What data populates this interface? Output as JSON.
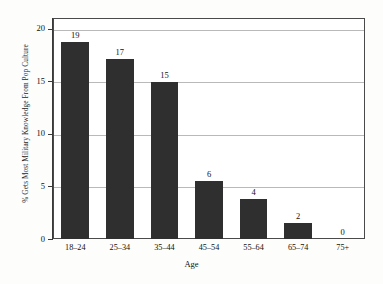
{
  "chart_data": {
    "type": "bar",
    "title": "",
    "subtitle": "",
    "xlabel": "Age",
    "ylabel": "% Gets Most Military Knowledge From Pop Culture",
    "categories": [
      "18–24",
      "25–34",
      "35–44",
      "45–54",
      "55–64",
      "65–74",
      "75+"
    ],
    "values": [
      18.7,
      17.1,
      14.9,
      5.5,
      3.8,
      1.5,
      0
    ],
    "data_labels": [
      "19",
      "17",
      "15",
      "6",
      "4",
      "2",
      "0"
    ],
    "ylim": [
      0,
      21
    ],
    "yticks": [
      0,
      5,
      10,
      15,
      20
    ],
    "ytick_labels": [
      "0",
      "5",
      "10",
      "15",
      "20"
    ],
    "grid": true,
    "legend": "none",
    "bar_color": "#2f2f2f",
    "gridline_color": "#b9b9b9",
    "frame_color": "#4a4a4a",
    "background_color": "#fdfdfc"
  }
}
